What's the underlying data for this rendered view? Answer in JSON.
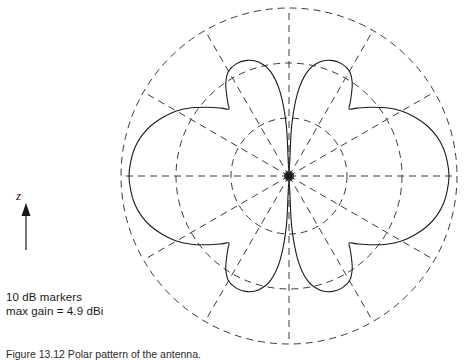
{
  "figure": {
    "axis_label": "z",
    "annotations": [
      "10 dB markers",
      "max gain = 4.9 dBi"
    ],
    "caption": "Figure 13.12  Polar pattern of the antenna.",
    "colors": {
      "curve": "#1a1a1a",
      "grid": "#3a3a3a",
      "background": "#ffffff"
    }
  },
  "chart_data": {
    "type": "line",
    "subtype": "polar-radiation-pattern",
    "title": "",
    "xlabel": "",
    "ylabel": "",
    "legend": [],
    "grid": true,
    "grid_style": "dashed",
    "radial_unit": "dB",
    "radial_marker_step_db": 10,
    "max_gain_dbi": 4.9,
    "center": {
      "x": 289,
      "y": 176
    },
    "outer_radius_px": 168,
    "ring_radii_px": [
      58,
      113,
      168
    ],
    "ring_labels_db": [
      "-20",
      "-10",
      "0"
    ],
    "spoke_count": 12,
    "spoke_step_deg": 30,
    "spoke_angles_deg": [
      0,
      30,
      60,
      90,
      120,
      150,
      180,
      210,
      240,
      270,
      300,
      330
    ],
    "axis_arrow_direction": "up",
    "axis_arrow_axis": "z",
    "lobes": [
      {
        "name": "main-lobe-right",
        "center_angle_deg": 0,
        "peak_radius_px": 160
      },
      {
        "name": "lobe-upper-right",
        "center_angle_deg": 62,
        "peak_radius_px": 124
      },
      {
        "name": "lobe-upper-left",
        "center_angle_deg": 118,
        "peak_radius_px": 124
      },
      {
        "name": "main-lobe-left",
        "center_angle_deg": 180,
        "peak_radius_px": 160
      },
      {
        "name": "lobe-lower-left",
        "center_angle_deg": 242,
        "peak_radius_px": 124
      },
      {
        "name": "lobe-lower-right",
        "center_angle_deg": 298,
        "peak_radius_px": 124
      }
    ],
    "nulls_deg": [
      90,
      270
    ],
    "pattern_samples_deg_radius": [
      [
        0,
        160
      ],
      [
        5,
        159
      ],
      [
        10,
        157
      ],
      [
        15,
        153
      ],
      [
        20,
        147
      ],
      [
        25,
        139
      ],
      [
        30,
        130
      ],
      [
        35,
        119
      ],
      [
        40,
        107
      ],
      [
        45,
        96
      ],
      [
        48,
        90
      ],
      [
        50,
        95
      ],
      [
        53,
        104
      ],
      [
        56,
        113
      ],
      [
        60,
        121
      ],
      [
        65,
        124
      ],
      [
        70,
        123
      ],
      [
        75,
        118
      ],
      [
        80,
        106
      ],
      [
        84,
        84
      ],
      [
        87,
        50
      ],
      [
        90,
        4
      ],
      [
        93,
        50
      ],
      [
        96,
        84
      ],
      [
        100,
        106
      ],
      [
        105,
        118
      ],
      [
        110,
        123
      ],
      [
        115,
        124
      ],
      [
        120,
        121
      ],
      [
        124,
        113
      ],
      [
        127,
        104
      ],
      [
        130,
        95
      ],
      [
        132,
        90
      ],
      [
        135,
        96
      ],
      [
        140,
        107
      ],
      [
        145,
        119
      ],
      [
        150,
        130
      ],
      [
        155,
        139
      ],
      [
        160,
        147
      ],
      [
        165,
        153
      ],
      [
        170,
        157
      ],
      [
        175,
        159
      ],
      [
        180,
        160
      ],
      [
        185,
        159
      ],
      [
        190,
        157
      ],
      [
        195,
        153
      ],
      [
        200,
        147
      ],
      [
        205,
        139
      ],
      [
        210,
        130
      ],
      [
        215,
        119
      ],
      [
        220,
        107
      ],
      [
        225,
        96
      ],
      [
        228,
        90
      ],
      [
        230,
        95
      ],
      [
        233,
        104
      ],
      [
        236,
        113
      ],
      [
        240,
        121
      ],
      [
        245,
        124
      ],
      [
        250,
        123
      ],
      [
        255,
        118
      ],
      [
        260,
        106
      ],
      [
        264,
        84
      ],
      [
        267,
        50
      ],
      [
        270,
        4
      ],
      [
        273,
        50
      ],
      [
        276,
        84
      ],
      [
        280,
        106
      ],
      [
        285,
        118
      ],
      [
        290,
        123
      ],
      [
        295,
        124
      ],
      [
        300,
        121
      ],
      [
        304,
        113
      ],
      [
        307,
        104
      ],
      [
        310,
        95
      ],
      [
        312,
        90
      ],
      [
        315,
        96
      ],
      [
        320,
        107
      ],
      [
        325,
        119
      ],
      [
        330,
        130
      ],
      [
        335,
        139
      ],
      [
        340,
        147
      ],
      [
        345,
        153
      ],
      [
        350,
        157
      ],
      [
        355,
        159
      ]
    ]
  }
}
